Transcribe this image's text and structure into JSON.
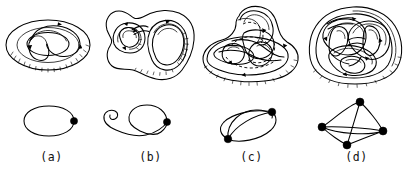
{
  "figure": {
    "kind": "line-drawing",
    "background_color": "#ffffff",
    "ink_color": "#000000",
    "width": 410,
    "height": 177
  },
  "panels": [
    {
      "id": "a",
      "caption": "(a)",
      "surface": {
        "name": "torus",
        "genus": 1,
        "loop_count": 1,
        "oriented": true
      },
      "graph": {
        "name": "wedge-of-1-circle",
        "vertices": 1,
        "edges": 1,
        "vertex_positions": [
          [
            74,
            121
          ]
        ],
        "loops": [
          "single round loop"
        ]
      }
    },
    {
      "id": "b",
      "caption": "(b)",
      "surface": {
        "name": "genus-2-surface",
        "genus": 2,
        "loop_count": 2,
        "oriented": true
      },
      "graph": {
        "name": "wedge-of-2-circles",
        "vertices": 1,
        "edges": 2,
        "vertex_positions": [
          [
            167,
            122
          ]
        ],
        "loops": [
          "large round loop",
          "narrow elongated loop"
        ]
      }
    },
    {
      "id": "c",
      "caption": "(c)",
      "surface": {
        "name": "genus-2-surface",
        "genus": 2,
        "loop_count": 3,
        "oriented": true
      },
      "graph": {
        "name": "theta-graph",
        "vertices": 2,
        "edges": 3,
        "vertex_positions": [
          [
            272,
            112
          ],
          [
            228,
            139
          ]
        ],
        "loops": [
          "three arcs joining the two vertices"
        ]
      }
    },
    {
      "id": "d",
      "caption": "(d)",
      "surface": {
        "name": "genus-3-surface",
        "genus": 3,
        "loop_count": 6,
        "oriented": true
      },
      "graph": {
        "name": "complete-graph-K4",
        "vertices": 4,
        "edges": 6,
        "vertex_positions": [
          [
            360,
            102
          ],
          [
            322,
            127
          ],
          [
            383,
            131
          ],
          [
            347,
            145
          ]
        ],
        "loops": [
          "tetrahedral 1-skeleton"
        ]
      }
    }
  ],
  "captions": {
    "a": "(a)",
    "b": "(b)",
    "c": "(c)",
    "d": "(d)"
  }
}
